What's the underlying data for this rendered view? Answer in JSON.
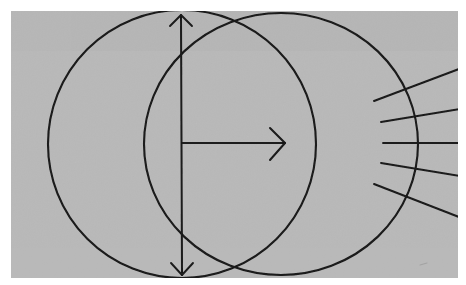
{
  "figure": {
    "title": "Two overlapping circles with centre arrows and radiating lines",
    "canvas": {
      "width": 466,
      "height": 285
    }
  },
  "colors": {
    "page_background": "#ffffff",
    "plate_background": "#b5b5b5",
    "plate_background_alt": "#b9b9b9",
    "ink": "#1a1a1a",
    "ink_soft": "#2b2b2b"
  },
  "plate": {
    "name": "scanned-plate",
    "x": 11,
    "y": 11,
    "width": 447,
    "height": 267,
    "speckle": "grain"
  },
  "chart_data": {
    "type": "diagram",
    "title": "Two overlapping circles with centre arrows and radiating lines",
    "xlabel": "",
    "ylabel": "",
    "xlim": [
      0,
      466
    ],
    "ylim": [
      0,
      285
    ],
    "grid": false,
    "legend": "none",
    "shapes": [
      {
        "id": "left-circle",
        "kind": "circle",
        "cx": 182,
        "cy": 144,
        "r": 134,
        "stroke": "#1a1a1a",
        "stroke_width": 2.1,
        "fill": "none"
      },
      {
        "id": "right-circle",
        "kind": "circle",
        "cx": 281,
        "cy": 144,
        "rx": 137,
        "ry": 131,
        "stroke": "#1a1a1a",
        "stroke_width": 2.1,
        "fill": "none"
      }
    ],
    "arrows": [
      {
        "id": "vertical-double-arrow",
        "kind": "double-headed",
        "x1": 181,
        "y1": 14,
        "x2": 182,
        "y2": 275,
        "orientation": "vertical",
        "head_size": 13,
        "stroke_width": 2.0
      },
      {
        "id": "horizontal-arrow",
        "kind": "single-headed",
        "x1": 182,
        "y1": 143,
        "x2": 284,
        "y2": 143,
        "orientation": "horizontal",
        "head_size": 16,
        "stroke_width": 2.0
      }
    ],
    "radiating_lines": {
      "count": 5,
      "converge_point": [
        455,
        143
      ],
      "description": "Five straight rays fanning from the right, crossing the right circle's right-hand arc",
      "segments": [
        {
          "id": "ray-1",
          "x1": 374,
          "y1": 101,
          "x2": 459,
          "y2": 69
        },
        {
          "id": "ray-2",
          "x1": 381,
          "y1": 122,
          "x2": 466,
          "y2": 108
        },
        {
          "id": "ray-3",
          "x1": 383,
          "y1": 143,
          "x2": 466,
          "y2": 143
        },
        {
          "id": "ray-4",
          "x1": 381,
          "y1": 163,
          "x2": 466,
          "y2": 177
        },
        {
          "id": "ray-5",
          "x1": 374,
          "y1": 184,
          "x2": 459,
          "y2": 217
        }
      ]
    },
    "intersections": [
      {
        "id": "upper-crossing",
        "x": 232,
        "y": 20
      },
      {
        "id": "lower-crossing",
        "x": 232,
        "y": 268
      }
    ],
    "centre": {
      "x": 182,
      "y": 143
    }
  },
  "annotations": {
    "labels": []
  }
}
